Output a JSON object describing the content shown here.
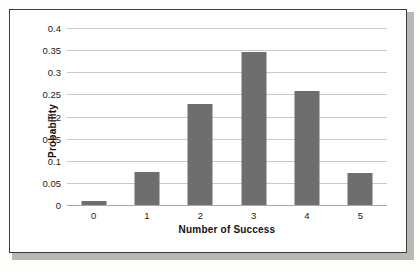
{
  "chart_data": {
    "type": "bar",
    "title": "",
    "subtitle": "",
    "xlabel": "Number of Success",
    "ylabel": "Probability",
    "categories": [
      "0",
      "1",
      "2",
      "3",
      "4",
      "5"
    ],
    "values": [
      0.01,
      0.075,
      0.228,
      0.345,
      0.257,
      0.073
    ],
    "ylim": [
      0,
      0.4
    ],
    "ytick_labels": [
      "0",
      "0.05",
      "0.1",
      "0.15",
      "0.2",
      "0.25",
      "0.3",
      "0.35",
      "0.4"
    ],
    "ytick_values": [
      0,
      0.05,
      0.1,
      0.15,
      0.2,
      0.25,
      0.3,
      0.35,
      0.4
    ],
    "grid": true,
    "legend": "none",
    "bar_color": "#6e6e6e",
    "gridline_color": "#c9c9c9",
    "axis_color": "#a8a8a8",
    "frame_color": "#3b3b3b",
    "background_color": "#ffffff"
  }
}
